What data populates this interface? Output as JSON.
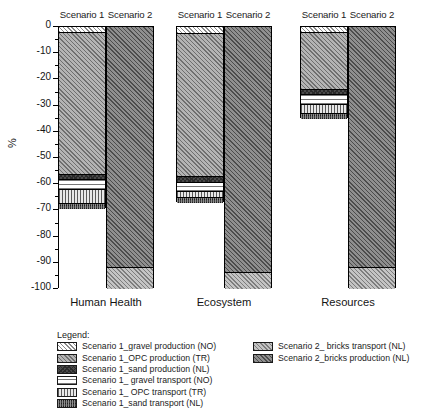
{
  "chart_data": {
    "type": "bar",
    "subtype": "stacked-bar-grouped",
    "title": "",
    "xlabel": "",
    "ylabel": "%",
    "ylim": [
      -100,
      0
    ],
    "y_ticks": [
      0,
      -10,
      -20,
      -30,
      -40,
      -50,
      -60,
      -70,
      -80,
      -90,
      -100
    ],
    "y_tick_labels": [
      "0",
      "-10",
      "-20",
      "-30",
      "-40",
      "-50",
      "-60",
      "-70",
      "-80",
      "-90",
      "-100"
    ],
    "grid": false,
    "legend_position": "bottom",
    "categories": [
      "Human Health",
      "Ecosystem",
      "Resources"
    ],
    "group_labels": [
      "Scenario 1",
      "Scenario 2"
    ],
    "series": [
      {
        "name": "Scenario 1_gravel production (NO)",
        "scenario": "Scenario 1",
        "pattern": "p-s1-gravel-prod",
        "values": [
          -2.0,
          -2.3,
          -2.0
        ]
      },
      {
        "name": "Scenario 1_OPC production (TR)",
        "scenario": "Scenario 1",
        "pattern": "p-s1-opc-prod",
        "values": [
          -54.0,
          -54.7,
          -21.5
        ]
      },
      {
        "name": "Scenario 1_sand production (NL)",
        "scenario": "Scenario 1",
        "pattern": "p-s1-sand-prod",
        "values": [
          -2.0,
          -2.0,
          -2.0
        ]
      },
      {
        "name": "Scenario 1_ gravel transport (NO)",
        "scenario": "Scenario 1",
        "pattern": "p-s1-gravel-trans",
        "values": [
          -4.0,
          -3.5,
          -4.0
        ]
      },
      {
        "name": "Scenario 1_ OPC transport (TR)",
        "scenario": "Scenario 1",
        "pattern": "p-s1-opc-trans",
        "values": [
          -5.0,
          -2.5,
          -3.5
        ]
      },
      {
        "name": "Scenario 1_sand transport (NL)",
        "scenario": "Scenario 1",
        "pattern": "p-s1-sand-trans",
        "values": [
          -2.5,
          -2.0,
          -2.0
        ]
      },
      {
        "name": "Scenario 2_ bricks transport (NL)",
        "scenario": "Scenario 2",
        "pattern": "p-s2-bricks-trans",
        "values": [
          -8.5,
          -6.5,
          -8.5
        ]
      },
      {
        "name": "Scenario 2_bricks production (NL)",
        "scenario": "Scenario 2",
        "pattern": "p-s2-bricks-prod",
        "values": [
          -91.5,
          -93.5,
          -91.5
        ]
      }
    ],
    "totals": {
      "Scenario 1": [
        -69.5,
        -67.0,
        -35.0
      ],
      "Scenario 2": [
        -100.0,
        -100.0,
        -100.0
      ]
    }
  },
  "axis": {
    "y_title": "%"
  },
  "panels": [
    {
      "category": "Human Health",
      "scenario1_label": "Scenario 1",
      "scenario2_label": "Scenario 2",
      "scenario1_segments": [
        {
          "key": "gravel-production-no",
          "pattern": "p-s1-gravel-prod",
          "start": 0.0,
          "end": -2.0
        },
        {
          "key": "opc-production-tr",
          "pattern": "p-s1-opc-prod",
          "start": -2.0,
          "end": -56.0
        },
        {
          "key": "sand-production-nl",
          "pattern": "p-s1-sand-prod",
          "start": -56.0,
          "end": -58.0
        },
        {
          "key": "gravel-transport-no",
          "pattern": "p-s1-gravel-trans",
          "start": -58.0,
          "end": -62.0
        },
        {
          "key": "opc-transport-tr",
          "pattern": "p-s1-opc-trans",
          "start": -62.0,
          "end": -67.0
        },
        {
          "key": "sand-transport-nl",
          "pattern": "p-s1-sand-trans",
          "start": -67.0,
          "end": -69.5
        }
      ],
      "scenario2_segments": [
        {
          "key": "bricks-production-nl",
          "pattern": "p-s2-bricks-prod",
          "start": 0.0,
          "end": -91.5
        },
        {
          "key": "bricks-transport-nl",
          "pattern": "p-s2-bricks-trans",
          "start": -91.5,
          "end": -100.0
        }
      ]
    },
    {
      "category": "Ecosystem",
      "scenario1_label": "Scenario 1",
      "scenario2_label": "Scenario 2",
      "scenario1_segments": [
        {
          "key": "gravel-production-no",
          "pattern": "p-s1-gravel-prod",
          "start": 0.0,
          "end": -2.3
        },
        {
          "key": "opc-production-tr",
          "pattern": "p-s1-opc-prod",
          "start": -2.3,
          "end": -57.0
        },
        {
          "key": "sand-production-nl",
          "pattern": "p-s1-sand-prod",
          "start": -57.0,
          "end": -59.0
        },
        {
          "key": "gravel-transport-no",
          "pattern": "p-s1-gravel-trans",
          "start": -59.0,
          "end": -62.5
        },
        {
          "key": "opc-transport-tr",
          "pattern": "p-s1-opc-trans",
          "start": -62.5,
          "end": -65.0
        },
        {
          "key": "sand-transport-nl",
          "pattern": "p-s1-sand-trans",
          "start": -65.0,
          "end": -67.0
        }
      ],
      "scenario2_segments": [
        {
          "key": "bricks-production-nl",
          "pattern": "p-s2-bricks-prod",
          "start": 0.0,
          "end": -93.5
        },
        {
          "key": "bricks-transport-nl",
          "pattern": "p-s2-bricks-trans",
          "start": -93.5,
          "end": -100.0
        }
      ]
    },
    {
      "category": "Resources",
      "scenario1_label": "Scenario 1",
      "scenario2_label": "Scenario 2",
      "scenario1_segments": [
        {
          "key": "gravel-production-no",
          "pattern": "p-s1-gravel-prod",
          "start": 0.0,
          "end": -2.0
        },
        {
          "key": "opc-production-tr",
          "pattern": "p-s1-opc-prod",
          "start": -2.0,
          "end": -23.5
        },
        {
          "key": "sand-production-nl",
          "pattern": "p-s1-sand-prod",
          "start": -23.5,
          "end": -25.5
        },
        {
          "key": "gravel-transport-no",
          "pattern": "p-s1-gravel-trans",
          "start": -25.5,
          "end": -29.5
        },
        {
          "key": "opc-transport-tr",
          "pattern": "p-s1-opc-trans",
          "start": -29.5,
          "end": -33.0
        },
        {
          "key": "sand-transport-nl",
          "pattern": "p-s1-sand-trans",
          "start": -33.0,
          "end": -35.0
        }
      ],
      "scenario2_segments": [
        {
          "key": "bricks-production-nl",
          "pattern": "p-s2-bricks-prod",
          "start": 0.0,
          "end": -91.5
        },
        {
          "key": "bricks-transport-nl",
          "pattern": "p-s2-bricks-trans",
          "start": -91.5,
          "end": -100.0
        }
      ]
    }
  ],
  "legend": {
    "title": "Legend:",
    "left_column": [
      {
        "label": "Scenario 1_gravel production (NO)",
        "pattern": "p-s1-gravel-prod"
      },
      {
        "label": "Scenario 1_OPC production (TR)",
        "pattern": "p-s1-opc-prod"
      },
      {
        "label": "Scenario 1_sand production (NL)",
        "pattern": "p-s1-sand-prod"
      },
      {
        "label": "Scenario 1_ gravel transport (NO)",
        "pattern": "p-s1-gravel-trans"
      },
      {
        "label": "Scenario 1_ OPC transport (TR)",
        "pattern": "p-s1-opc-trans"
      },
      {
        "label": "Scenario 1_sand transport (NL)",
        "pattern": "p-s1-sand-trans"
      }
    ],
    "right_column": [
      {
        "label": "Scenario 2_ bricks transport (NL)",
        "pattern": "p-s2-bricks-trans"
      },
      {
        "label": "Scenario 2_bricks production (NL)",
        "pattern": "p-s2-bricks-prod"
      }
    ]
  },
  "layout": {
    "plot_top_px": 26,
    "plot_bottom_px": 288,
    "panel_x": [
      58,
      176,
      300
    ],
    "bar_width": 48,
    "bar_gap": 0
  }
}
